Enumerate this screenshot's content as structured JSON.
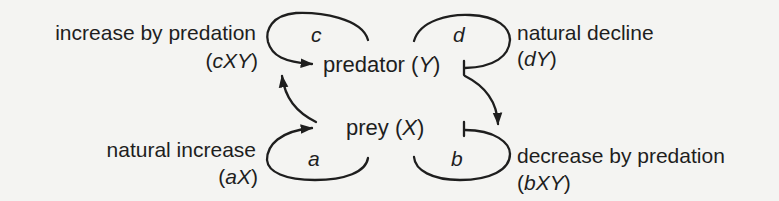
{
  "diagram": {
    "nodes": {
      "predator": {
        "label": "predator",
        "var_open": "(",
        "var": "Y",
        "var_close": ")"
      },
      "prey": {
        "label": "prey",
        "var_open": "(",
        "var": "X",
        "var_close": ")"
      }
    },
    "loops": {
      "c": {
        "coef": "c",
        "label": "increase by predation",
        "term_open": "(",
        "term_coef": "c",
        "term_vars": "XY",
        "term_close": ")",
        "effect": "positive"
      },
      "d": {
        "coef": "d",
        "label": "natural decline",
        "term_open": "(",
        "term_coef": "d",
        "term_vars": "Y",
        "term_close": ")",
        "effect": "negative"
      },
      "a": {
        "coef": "a",
        "label": "natural increase",
        "term_open": "(",
        "term_coef": "a",
        "term_vars": "X",
        "term_close": ")",
        "effect": "positive"
      },
      "b": {
        "coef": "b",
        "label": "decrease by predation",
        "term_open": "(",
        "term_coef": "b",
        "term_vars": "XY",
        "term_close": ")",
        "effect": "negative"
      }
    },
    "edges": [
      {
        "from": "prey",
        "to": "predator",
        "type": "activation"
      },
      {
        "from": "predator",
        "to": "prey",
        "type": "activation"
      }
    ],
    "colors": {
      "ink": "#1e1e1e",
      "background": "#f4f4f2"
    }
  }
}
